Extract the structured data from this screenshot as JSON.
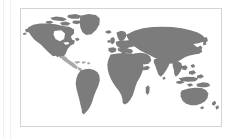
{
  "panel": {
    "background_color": "#ffffff",
    "width_px": 235,
    "height_px": 139
  },
  "guides": {
    "outer_rule_color": "#f0f0f0",
    "inner_rule_color": "#f0f0f0"
  },
  "map_frame": {
    "border_color": "#d4d4d4",
    "background_color": "#ffffff",
    "left_px": 20,
    "top_px": 8,
    "width_px": 202,
    "height_px": 119
  },
  "map": {
    "type": "world-choropleth",
    "projection": "equirectangular",
    "land_color": "#7c7c7c",
    "highlight_color": "#a9a9a9",
    "ocean_color": "#ffffff",
    "title": "",
    "legend": [],
    "labels": [],
    "regions": [
      {
        "name": "north-america",
        "fill": "land"
      },
      {
        "name": "greenland",
        "fill": "land"
      },
      {
        "name": "central-america",
        "fill": "highlight"
      },
      {
        "name": "caribbean",
        "fill": "highlight"
      },
      {
        "name": "south-america",
        "fill": "land"
      },
      {
        "name": "europe",
        "fill": "land"
      },
      {
        "name": "africa",
        "fill": "land"
      },
      {
        "name": "asia",
        "fill": "land"
      },
      {
        "name": "india",
        "fill": "land"
      },
      {
        "name": "southeast-asia",
        "fill": "land"
      },
      {
        "name": "japan",
        "fill": "land"
      },
      {
        "name": "indonesia",
        "fill": "land"
      },
      {
        "name": "australia",
        "fill": "land"
      },
      {
        "name": "new-zealand",
        "fill": "land"
      },
      {
        "name": "madagascar",
        "fill": "land"
      },
      {
        "name": "iceland",
        "fill": "land"
      },
      {
        "name": "british-isles",
        "fill": "land"
      },
      {
        "name": "arctic-islands",
        "fill": "land"
      }
    ]
  }
}
